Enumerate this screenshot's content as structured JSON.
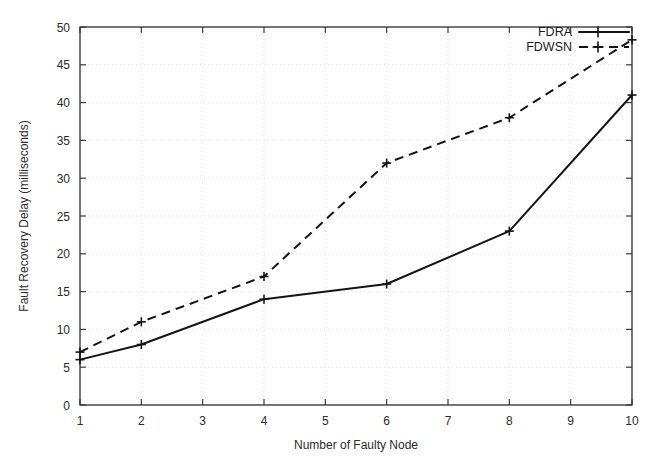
{
  "chart_data": {
    "type": "line",
    "title": "",
    "xlabel": "Number of Faulty Node",
    "ylabel": "Fault Recovery Delay (milliseconds)",
    "xlim": [
      1,
      10
    ],
    "ylim": [
      0,
      50
    ],
    "xticks": [
      1,
      2,
      3,
      4,
      5,
      6,
      7,
      8,
      9,
      10
    ],
    "yticks": [
      0,
      5,
      10,
      15,
      20,
      25,
      30,
      35,
      40,
      45,
      50
    ],
    "xtick_labels": [
      "1",
      "2",
      "3",
      "4",
      "5",
      "6",
      "7",
      "8",
      "9",
      "10"
    ],
    "ytick_labels": [
      "0",
      "5",
      "10",
      "15",
      "20",
      "25",
      "30",
      "35",
      "40",
      "45",
      "50"
    ],
    "grid": true,
    "legend_position": "top-right",
    "series": [
      {
        "name": "FDRA",
        "style": "solid",
        "marker": "plus",
        "color": "#141414",
        "x": [
          1,
          2,
          4,
          6,
          8,
          10
        ],
        "values": [
          6,
          8,
          14,
          16,
          23,
          41
        ]
      },
      {
        "name": "FDWSN",
        "style": "dashed",
        "marker": "plus",
        "color": "#141414",
        "x": [
          1,
          2,
          4,
          6,
          8,
          10
        ],
        "values": [
          7,
          11,
          17,
          32,
          38,
          48.3
        ]
      }
    ]
  },
  "legend": {
    "entries": [
      {
        "label": "FDRA"
      },
      {
        "label": "FDWSN"
      }
    ]
  },
  "axes": {
    "x_title": "Number of Faulty Node",
    "y_title": "Fault Recovery Delay (milliseconds)"
  }
}
